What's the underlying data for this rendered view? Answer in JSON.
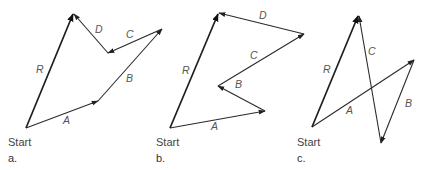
{
  "figures": [
    {
      "id": "a",
      "panel_label": "a.",
      "start_label": "Start",
      "vectors": {
        "A": "A",
        "B": "B",
        "C": "C",
        "D": "D",
        "R": "R"
      }
    },
    {
      "id": "b",
      "panel_label": "b.",
      "start_label": "Start",
      "vectors": {
        "A": "A",
        "B": "B",
        "C": "C",
        "D": "D",
        "R": "R"
      }
    },
    {
      "id": "c",
      "panel_label": "c.",
      "start_label": "Start",
      "vectors": {
        "A": "A",
        "B": "B",
        "C": "C",
        "R": "R"
      }
    }
  ],
  "colors": {
    "stroke": "#2a2a2a",
    "label": "#555555",
    "background": "#ffffff"
  }
}
